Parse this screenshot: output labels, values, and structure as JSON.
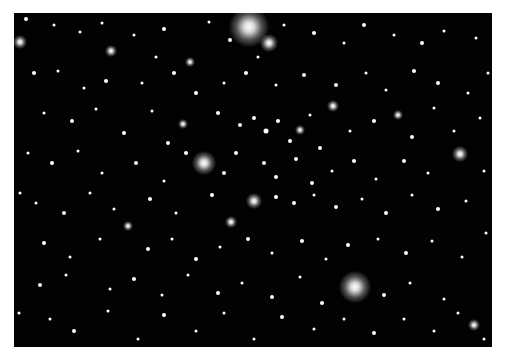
{
  "image": {
    "subject": "star cluster field",
    "background": "#020202",
    "border": "#ffffff",
    "bright_stars": [
      {
        "x": 235,
        "y": 14,
        "r": 20
      },
      {
        "x": 255,
        "y": 30,
        "r": 9
      },
      {
        "x": 6,
        "y": 29,
        "r": 7
      },
      {
        "x": 190,
        "y": 150,
        "r": 12
      },
      {
        "x": 341,
        "y": 274,
        "r": 16
      },
      {
        "x": 446,
        "y": 141,
        "r": 8
      },
      {
        "x": 240,
        "y": 188,
        "r": 8
      },
      {
        "x": 319,
        "y": 93,
        "r": 6
      },
      {
        "x": 217,
        "y": 209,
        "r": 6
      },
      {
        "x": 97,
        "y": 38,
        "r": 6
      },
      {
        "x": 460,
        "y": 312,
        "r": 6
      },
      {
        "x": 176,
        "y": 49,
        "r": 5
      },
      {
        "x": 169,
        "y": 111,
        "r": 5
      },
      {
        "x": 286,
        "y": 117,
        "r": 5
      },
      {
        "x": 384,
        "y": 102,
        "r": 5
      },
      {
        "x": 114,
        "y": 213,
        "r": 5
      }
    ],
    "stars": [
      [
        12,
        6,
        2
      ],
      [
        40,
        12,
        1.5
      ],
      [
        66,
        19,
        1.5
      ],
      [
        88,
        10,
        1.5
      ],
      [
        120,
        22,
        1.5
      ],
      [
        150,
        16,
        2
      ],
      [
        195,
        9,
        1.5
      ],
      [
        216,
        27,
        2
      ],
      [
        270,
        12,
        1.5
      ],
      [
        300,
        20,
        2
      ],
      [
        330,
        30,
        1.5
      ],
      [
        350,
        12,
        2
      ],
      [
        380,
        22,
        1.5
      ],
      [
        408,
        30,
        2
      ],
      [
        430,
        18,
        1.5
      ],
      [
        462,
        25,
        1.5
      ],
      [
        20,
        60,
        2
      ],
      [
        44,
        58,
        1.5
      ],
      [
        70,
        75,
        1.5
      ],
      [
        92,
        68,
        2
      ],
      [
        128,
        70,
        1.5
      ],
      [
        160,
        60,
        2
      ],
      [
        182,
        80,
        2
      ],
      [
        210,
        70,
        1.5
      ],
      [
        232,
        60,
        2
      ],
      [
        262,
        72,
        1.5
      ],
      [
        290,
        62,
        2
      ],
      [
        322,
        72,
        2
      ],
      [
        352,
        60,
        1.5
      ],
      [
        372,
        77,
        1.5
      ],
      [
        400,
        58,
        2
      ],
      [
        424,
        70,
        2
      ],
      [
        454,
        80,
        1.5
      ],
      [
        30,
        100,
        1.5
      ],
      [
        58,
        108,
        2
      ],
      [
        82,
        96,
        1.5
      ],
      [
        110,
        120,
        2
      ],
      [
        138,
        98,
        1.5
      ],
      [
        154,
        130,
        2
      ],
      [
        204,
        100,
        2
      ],
      [
        226,
        112,
        2
      ],
      [
        240,
        105,
        2
      ],
      [
        252,
        118,
        2.5
      ],
      [
        264,
        108,
        2
      ],
      [
        276,
        128,
        2
      ],
      [
        296,
        102,
        1.5
      ],
      [
        306,
        135,
        2
      ],
      [
        336,
        118,
        1.5
      ],
      [
        360,
        108,
        2
      ],
      [
        398,
        124,
        2
      ],
      [
        420,
        95,
        1.5
      ],
      [
        440,
        118,
        1.5
      ],
      [
        466,
        105,
        1.5
      ],
      [
        14,
        140,
        1.5
      ],
      [
        38,
        150,
        2
      ],
      [
        64,
        138,
        1.5
      ],
      [
        88,
        160,
        1.5
      ],
      [
        122,
        150,
        2
      ],
      [
        150,
        168,
        1.5
      ],
      [
        172,
        140,
        2
      ],
      [
        210,
        160,
        2
      ],
      [
        222,
        140,
        2
      ],
      [
        250,
        150,
        2
      ],
      [
        262,
        164,
        2
      ],
      [
        282,
        146,
        2
      ],
      [
        298,
        170,
        2
      ],
      [
        318,
        158,
        1.5
      ],
      [
        340,
        148,
        2
      ],
      [
        362,
        166,
        1.5
      ],
      [
        390,
        148,
        2
      ],
      [
        414,
        160,
        1.5
      ],
      [
        470,
        158,
        1.5
      ],
      [
        22,
        190,
        1.5
      ],
      [
        50,
        200,
        2
      ],
      [
        76,
        180,
        1.5
      ],
      [
        100,
        196,
        1.5
      ],
      [
        136,
        186,
        2
      ],
      [
        162,
        200,
        1.5
      ],
      [
        198,
        182,
        2
      ],
      [
        262,
        184,
        2
      ],
      [
        280,
        190,
        2
      ],
      [
        300,
        182,
        1.5
      ],
      [
        322,
        194,
        2
      ],
      [
        348,
        186,
        1.5
      ],
      [
        372,
        200,
        2
      ],
      [
        398,
        182,
        1.5
      ],
      [
        424,
        196,
        2
      ],
      [
        452,
        188,
        1.5
      ],
      [
        30,
        230,
        2
      ],
      [
        56,
        244,
        1.5
      ],
      [
        86,
        226,
        1.5
      ],
      [
        134,
        236,
        2
      ],
      [
        158,
        226,
        1.5
      ],
      [
        182,
        246,
        2
      ],
      [
        206,
        234,
        1.5
      ],
      [
        234,
        226,
        2
      ],
      [
        258,
        240,
        1.5
      ],
      [
        288,
        228,
        2
      ],
      [
        312,
        246,
        1.5
      ],
      [
        334,
        232,
        2
      ],
      [
        364,
        226,
        1.5
      ],
      [
        392,
        240,
        2
      ],
      [
        418,
        228,
        1.5
      ],
      [
        448,
        244,
        1.5
      ],
      [
        26,
        272,
        2
      ],
      [
        52,
        262,
        1.5
      ],
      [
        96,
        276,
        1.5
      ],
      [
        120,
        266,
        2
      ],
      [
        148,
        282,
        1.5
      ],
      [
        174,
        262,
        1.5
      ],
      [
        204,
        280,
        2
      ],
      [
        228,
        270,
        1.5
      ],
      [
        258,
        284,
        2
      ],
      [
        286,
        264,
        1.5
      ],
      [
        308,
        290,
        2
      ],
      [
        370,
        282,
        2
      ],
      [
        396,
        270,
        1.5
      ],
      [
        430,
        286,
        1.5
      ],
      [
        36,
        306,
        1.5
      ],
      [
        60,
        318,
        2
      ],
      [
        94,
        298,
        1.5
      ],
      [
        124,
        326,
        1.5
      ],
      [
        150,
        302,
        2
      ],
      [
        182,
        318,
        1.5
      ],
      [
        210,
        300,
        1.5
      ],
      [
        240,
        326,
        1.5
      ],
      [
        268,
        304,
        2
      ],
      [
        300,
        316,
        1.5
      ],
      [
        330,
        306,
        1.5
      ],
      [
        360,
        320,
        2
      ],
      [
        390,
        306,
        1.5
      ],
      [
        420,
        318,
        1.5
      ],
      [
        444,
        300,
        1.5
      ],
      [
        470,
        326,
        1.5
      ],
      [
        6,
        180,
        1.5
      ],
      [
        474,
        60,
        1.5
      ],
      [
        472,
        220,
        1.5
      ],
      [
        5,
        300,
        1.5
      ],
      [
        244,
        44,
        1.5
      ],
      [
        142,
        44,
        1.5
      ]
    ]
  }
}
